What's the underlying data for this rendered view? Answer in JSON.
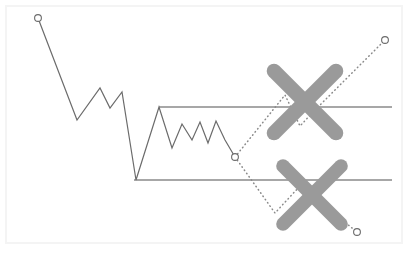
{
  "figure": {
    "title": "",
    "background_color": "#ffffff",
    "panel_border_color": "#f4f4f4",
    "width": 412,
    "height": 259
  },
  "colors": {
    "price_line": "#6b6b6b",
    "channel_line": "#8a8a8a",
    "projection_line": "#8a8a8a",
    "marker_stroke": "#6b6b6b",
    "marker_fill": "#ffffff",
    "cross_mark": "#9a9a9a"
  },
  "chart_data": {
    "type": "line",
    "title": "",
    "subtitle": "",
    "xlabel": "",
    "ylabel": "",
    "xlim": [
      0,
      412
    ],
    "ylim": [
      259,
      0
    ],
    "grid": false,
    "legend": false,
    "legend_position": "none",
    "annotations": [
      {
        "name": "resistance-level",
        "kind": "horizontal-line",
        "y": 107,
        "x_start": 159,
        "x_end": 392,
        "label": ""
      },
      {
        "name": "support-level",
        "kind": "horizontal-line",
        "y": 180,
        "x_start": 134,
        "x_end": 392,
        "label": ""
      },
      {
        "name": "upper-scenario-rejected",
        "kind": "cross-mark",
        "cx": 305,
        "cy": 102,
        "size": 62,
        "label": "X"
      },
      {
        "name": "lower-scenario-rejected",
        "kind": "cross-mark",
        "cx": 312,
        "cy": 195,
        "size": 58,
        "label": "X"
      }
    ],
    "series": [
      {
        "name": "price-history",
        "style": "solid",
        "marker_start": true,
        "marker_end": false,
        "points": [
          [
            38,
            18
          ],
          [
            77,
            120
          ],
          [
            100,
            88
          ],
          [
            110,
            108
          ],
          [
            122,
            92
          ],
          [
            136,
            180
          ],
          [
            159,
            107
          ],
          [
            172,
            148
          ],
          [
            182,
            124
          ],
          [
            192,
            140
          ],
          [
            200,
            122
          ],
          [
            208,
            143
          ],
          [
            216,
            121
          ],
          [
            225,
            140
          ],
          [
            235,
            157
          ]
        ]
      },
      {
        "name": "bullish-projection",
        "style": "dotted",
        "marker_start": true,
        "marker_end": true,
        "points": [
          [
            235,
            157
          ],
          [
            285,
            95
          ],
          [
            300,
            126
          ],
          [
            316,
            109
          ],
          [
            385,
            40
          ]
        ]
      },
      {
        "name": "bearish-projection",
        "style": "dotted",
        "marker_start": true,
        "marker_end": true,
        "points": [
          [
            235,
            157
          ],
          [
            275,
            213
          ],
          [
            300,
            186
          ],
          [
            357,
            232
          ]
        ]
      }
    ],
    "markers": [
      {
        "name": "start-point",
        "x": 38,
        "y": 18
      },
      {
        "name": "branch-point",
        "x": 235,
        "y": 157
      },
      {
        "name": "bullish-target",
        "x": 385,
        "y": 40
      },
      {
        "name": "bearish-target",
        "x": 357,
        "y": 232
      }
    ]
  }
}
